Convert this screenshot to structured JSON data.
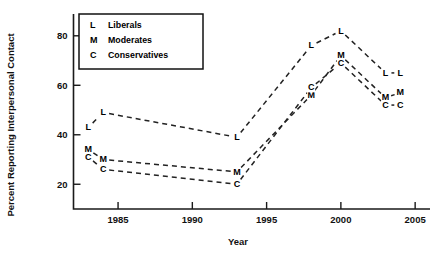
{
  "chart_data": {
    "type": "line",
    "title": "",
    "xlabel": "Year",
    "ylabel": "Percent Reporting Interpersonal Contact",
    "xlim": [
      1982,
      2006
    ],
    "ylim": [
      10,
      88
    ],
    "xticks": [
      1985,
      1990,
      1995,
      2000,
      2005
    ],
    "yticks": [
      20,
      40,
      60,
      80
    ],
    "grid": false,
    "legend_position": "upper-left-inset",
    "marker_style": "letter-labels",
    "line_style": "dashed",
    "series": [
      {
        "name": "Liberals",
        "key": "L",
        "x": [
          1983,
          1984,
          1993,
          1998,
          2000,
          2003,
          2004
        ],
        "values": [
          43,
          49,
          39,
          76,
          82,
          65,
          65
        ]
      },
      {
        "name": "Moderates",
        "key": "M",
        "x": [
          1983,
          1984,
          1993,
          1998,
          2000,
          2003,
          2004
        ],
        "values": [
          34,
          30,
          25,
          56,
          72,
          55,
          57
        ]
      },
      {
        "name": "Conservatives",
        "key": "C",
        "x": [
          1983,
          1984,
          1993,
          1998,
          2000,
          2003,
          2004
        ],
        "values": [
          31,
          26,
          20,
          59,
          69,
          52,
          52
        ]
      }
    ],
    "legend": [
      {
        "key": "L",
        "label": "Liberals"
      },
      {
        "key": "M",
        "label": "Moderates"
      },
      {
        "key": "C",
        "label": "Conservatives"
      }
    ],
    "colors": {
      "axis": "#1a1a1a",
      "line": "#222222",
      "text": "#000000",
      "background": "#ffffff"
    }
  }
}
